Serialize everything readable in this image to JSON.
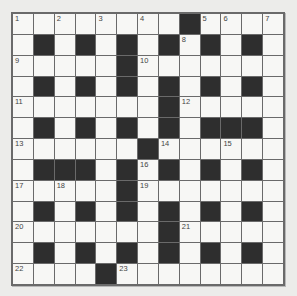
{
  "puzzle": {
    "rows": 13,
    "cols": 13,
    "colors": {
      "white": "#f7f7f5",
      "black": "#2e2e2e",
      "grid_line": "#6a6a6a",
      "background": "#ececea"
    },
    "grid": [
      "........#....",
      ".#.#.#.#.#.#.",
      ".....#.......",
      ".#.#.#.#.#.#.",
      ".......#.....",
      ".#.#.#.#.###.",
      "......#......",
      ".###.#.#.#.#.",
      ".....#.......",
      ".#.#.#.#.#.#.",
      ".......#.....",
      ".#.#.#.#.#.#.",
      "....#........"
    ],
    "numbers": [
      {
        "n": "1",
        "r": 0,
        "c": 0
      },
      {
        "n": "2",
        "r": 0,
        "c": 2
      },
      {
        "n": "3",
        "r": 0,
        "c": 4
      },
      {
        "n": "4",
        "r": 0,
        "c": 6
      },
      {
        "n": "5",
        "r": 0,
        "c": 9
      },
      {
        "n": "6",
        "r": 0,
        "c": 10
      },
      {
        "n": "7",
        "r": 0,
        "c": 12
      },
      {
        "n": "8",
        "r": 1,
        "c": 8
      },
      {
        "n": "9",
        "r": 2,
        "c": 0
      },
      {
        "n": "10",
        "r": 2,
        "c": 6
      },
      {
        "n": "11",
        "r": 4,
        "c": 0
      },
      {
        "n": "12",
        "r": 4,
        "c": 8
      },
      {
        "n": "13",
        "r": 6,
        "c": 0
      },
      {
        "n": "14",
        "r": 6,
        "c": 7
      },
      {
        "n": "15",
        "r": 6,
        "c": 10
      },
      {
        "n": "16",
        "r": 7,
        "c": 6
      },
      {
        "n": "17",
        "r": 8,
        "c": 0
      },
      {
        "n": "18",
        "r": 8,
        "c": 2
      },
      {
        "n": "19",
        "r": 8,
        "c": 6
      },
      {
        "n": "20",
        "r": 10,
        "c": 0
      },
      {
        "n": "21",
        "r": 10,
        "c": 8
      },
      {
        "n": "22",
        "r": 12,
        "c": 0
      },
      {
        "n": "23",
        "r": 12,
        "c": 5
      }
    ]
  }
}
